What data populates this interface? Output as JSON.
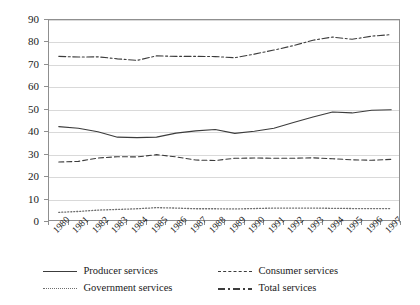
{
  "chart_data": {
    "type": "line",
    "title": "",
    "subtitle": "",
    "xlabel": "",
    "ylabel": "",
    "xlim": [
      1980,
      1997
    ],
    "ylim": [
      0,
      90
    ],
    "ytick_step": 10,
    "grid": true,
    "grid_axis": "y",
    "legend_position": "bottom",
    "x": [
      1980,
      1981,
      1982,
      1983,
      1984,
      1985,
      1986,
      1987,
      1988,
      1989,
      1990,
      1991,
      1992,
      1993,
      1994,
      1995,
      1996,
      1997
    ],
    "categories": [
      "1980",
      "1981",
      "1982",
      "1983",
      "1984",
      "1985",
      "1986",
      "1987",
      "1988",
      "1989",
      "1990",
      "1991",
      "1992",
      "1993",
      "1994",
      "1995",
      "1996",
      "1997"
    ],
    "yticks": [
      "0",
      "10",
      "20",
      "30",
      "40",
      "50",
      "60",
      "70",
      "80",
      "90"
    ],
    "series": [
      {
        "name": "Producer services",
        "style": "solid",
        "color": "#3c3c3c",
        "values": [
          42.5,
          41.8,
          40.2,
          37.8,
          37.6,
          37.8,
          39.6,
          40.6,
          41.2,
          39.5,
          40.4,
          41.8,
          44.3,
          46.8,
          49.0,
          48.6,
          49.8,
          50.0
        ]
      },
      {
        "name": "Consumer services",
        "style": "dashed",
        "color": "#3c3c3c",
        "values": [
          26.7,
          27.0,
          28.5,
          29.1,
          29.0,
          30.0,
          29.0,
          27.6,
          27.4,
          28.4,
          28.5,
          28.4,
          28.4,
          28.6,
          28.2,
          27.7,
          27.5,
          27.9
        ]
      },
      {
        "name": "Government services",
        "style": "dotted",
        "color": "#6e6e6e",
        "values": [
          4.3,
          4.7,
          5.3,
          5.6,
          5.9,
          6.4,
          6.2,
          5.9,
          5.9,
          5.8,
          6.0,
          6.2,
          6.2,
          6.2,
          6.1,
          6.0,
          6.0,
          6.0
        ]
      },
      {
        "name": "Total services",
        "style": "dashdot",
        "color": "#3c3c3c",
        "values": [
          73.8,
          73.5,
          73.6,
          72.7,
          72.0,
          74.0,
          73.8,
          73.8,
          73.7,
          73.2,
          74.8,
          76.6,
          78.6,
          81.0,
          82.4,
          81.4,
          82.8,
          83.5
        ]
      }
    ]
  },
  "legend": {
    "items": [
      {
        "label": "Producer services",
        "style": "solid"
      },
      {
        "label": "Consumer services",
        "style": "dashed"
      },
      {
        "label": "Government services",
        "style": "dotted"
      },
      {
        "label": "Total services",
        "style": "dashdot"
      }
    ]
  }
}
